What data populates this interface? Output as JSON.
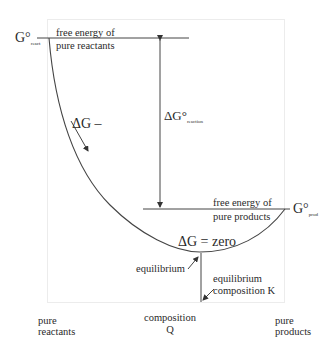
{
  "diagram": {
    "g_react": {
      "symbol": "G°",
      "subscript": "react"
    },
    "g_prod": {
      "symbol": "G°",
      "subscript": "prod"
    },
    "top_line_label": [
      "free energy of",
      "pure reactants"
    ],
    "bottom_line_label": [
      "free energy of",
      "pure products"
    ],
    "delta_g_reaction": {
      "symbol": "ΔG°",
      "subscript": "reaction"
    },
    "delta_g_minus": "ΔG –",
    "delta_g_zero": "ΔG = zero",
    "equilibrium_label": "equilibrium",
    "equilibrium_composition_label": [
      "equilibrium",
      "composition K"
    ],
    "x_axis": {
      "left": [
        "pure",
        "reactants"
      ],
      "middle": [
        "composition",
        "Q"
      ],
      "right": [
        "pure",
        "products"
      ]
    },
    "colors": {
      "line": "#333333",
      "frame": "#ececec",
      "text": "#2a2a2a"
    }
  }
}
